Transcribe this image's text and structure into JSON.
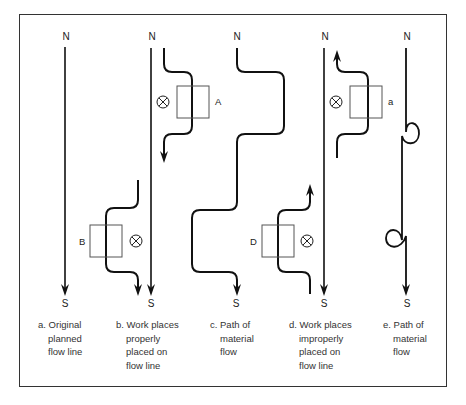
{
  "figure": {
    "panels": [
      {
        "id": "a",
        "north_label": "N",
        "south_label": "S",
        "caption": {
          "prefix": "a.",
          "lines": [
            "Original",
            "planned",
            "flow line"
          ]
        }
      },
      {
        "id": "b",
        "north_label": "N",
        "south_label": "S",
        "workplaces": [
          {
            "label": "A",
            "marker": "⊗"
          },
          {
            "label": "B",
            "marker": "⊗"
          }
        ],
        "caption": {
          "prefix": "b.",
          "lines": [
            "Work places",
            "properly",
            "placed on",
            "flow line"
          ]
        }
      },
      {
        "id": "c",
        "north_label": "N",
        "south_label": "S",
        "caption": {
          "prefix": "c.",
          "lines": [
            "Path of",
            "material",
            "flow"
          ]
        }
      },
      {
        "id": "d",
        "north_label": "N",
        "south_label": "S",
        "workplaces": [
          {
            "label": "a",
            "marker": "⊗"
          },
          {
            "label": "D",
            "marker": "⊗"
          }
        ],
        "caption": {
          "prefix": "d.",
          "lines": [
            "Work places",
            "improperly",
            "placed on",
            "flow line"
          ]
        }
      },
      {
        "id": "e",
        "north_label": "N",
        "south_label": "S",
        "caption": {
          "prefix": "e.",
          "lines": [
            "Path of",
            "material",
            "flow"
          ]
        }
      }
    ],
    "colors": {
      "line": "#111111",
      "box": "#555555",
      "frame": "#333333",
      "background": "#ffffff"
    }
  }
}
